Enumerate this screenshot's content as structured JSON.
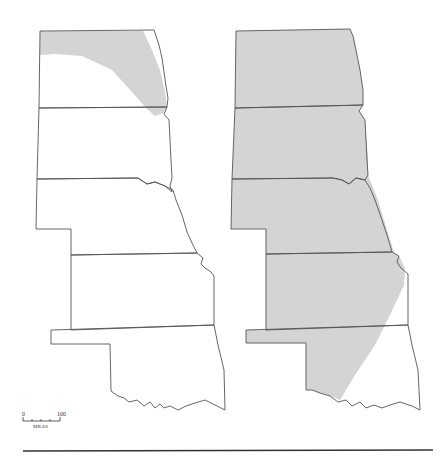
{
  "figure": {
    "panels": [
      {
        "id": "left",
        "states": [
          "North Dakota",
          "South Dakota",
          "Nebraska",
          "Kansas",
          "Oklahoma"
        ],
        "shaded_region": "northern and eastern North Dakota"
      },
      {
        "id": "right",
        "states": [
          "North Dakota",
          "South Dakota",
          "Nebraska",
          "Kansas",
          "Oklahoma"
        ],
        "shaded_region": "all states except eastern Kansas and eastern Oklahoma"
      }
    ],
    "colors": {
      "shade": "#d4d4d4",
      "border": "#555555"
    },
    "scale_bar": {
      "start_label": "0",
      "end_label": "100",
      "unit_label": "MILES"
    }
  }
}
